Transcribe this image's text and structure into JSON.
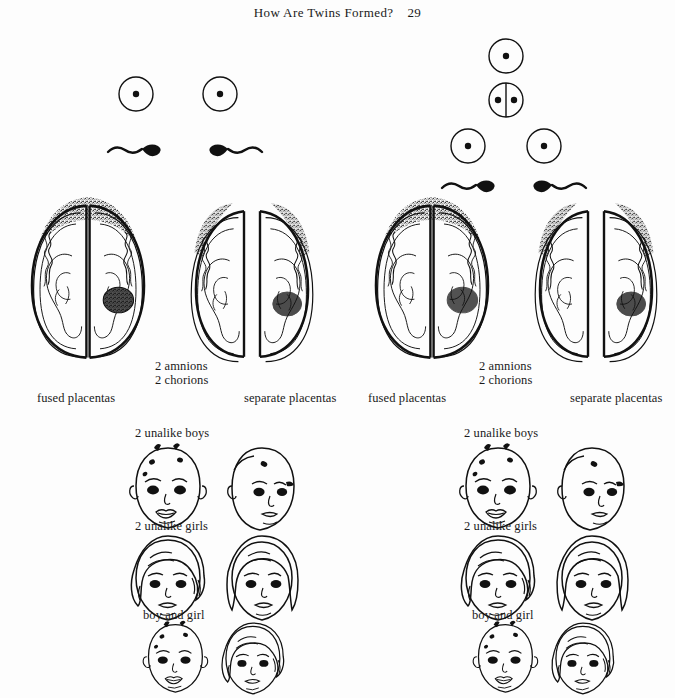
{
  "header": {
    "title": "How Are Twins Formed?",
    "page_number": "29"
  },
  "panels": [
    {
      "id": "fraternal",
      "gametes": {
        "description": "two separate eggs each fertilized by a separate sperm",
        "eggs": 2,
        "sperm": 2,
        "dividing_cell": false
      },
      "uterus_left_label": "fused placentas",
      "uterus_center_label_line1": "2 amnions",
      "uterus_center_label_line2": "2 chorions",
      "uterus_right_label": "separate placentas",
      "outcomes": [
        "2 unalike boys",
        "2 unalike girls",
        "boy and girl"
      ]
    },
    {
      "id": "identical",
      "gametes": {
        "description": "one egg fertilized then splitting into two cells",
        "eggs": 1,
        "sperm": 2,
        "dividing_cell": true,
        "daughter_cells": 2
      },
      "uterus_left_label": "fused placentas",
      "uterus_center_label_line1": "2 amnions",
      "uterus_center_label_line2": "2 chorions",
      "uterus_right_label": "separate placentas",
      "outcomes": [
        "2 unalike boys",
        "2 unalike girls",
        "boy and girl"
      ]
    }
  ],
  "colors": {
    "ink": "#111111",
    "paper": "#fdfdfd"
  }
}
